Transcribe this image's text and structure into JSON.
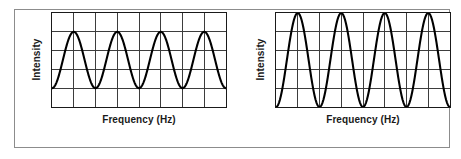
{
  "figure": {
    "background_color": "#ffffff",
    "frame_color": "#8c8c8c",
    "axis_color": "#1a1a1a",
    "grid_color": "#3a3a3a",
    "wave_color": "#000000"
  },
  "panels": [
    {
      "id": "left",
      "ylabel": "Intensity",
      "xlabel": "Frequency (Hz)"
    },
    {
      "id": "right",
      "ylabel": "Intensity",
      "xlabel": "Frequency (Hz)"
    }
  ],
  "chart_data": [
    {
      "type": "line",
      "title": "",
      "xlabel": "Frequency (Hz)",
      "ylabel": "Intensity",
      "xlim": [
        0,
        8
      ],
      "ylim": [
        0,
        5
      ],
      "grid": true,
      "grid_columns": 8,
      "grid_rows": 5,
      "xticklabels": [],
      "yticklabels": [],
      "legend": "none",
      "annotation": "low amplitude sine wave, 4 cycles",
      "waveform": {
        "shape": "sine",
        "cycles": 4,
        "amplitude": 1.5,
        "midline": 2.5,
        "peak": 4.0,
        "trough": 1.0,
        "phase_deg": 270
      },
      "x": [
        0,
        0.25,
        0.5,
        0.75,
        1,
        1.25,
        1.5,
        1.75,
        2,
        2.25,
        2.5,
        2.75,
        3,
        3.25,
        3.5,
        3.75,
        4,
        4.25,
        4.5,
        4.75,
        5,
        5.25,
        5.5,
        5.75,
        6,
        6.25,
        6.5,
        6.75,
        7,
        7.25,
        7.5,
        7.75,
        8
      ],
      "y": [
        1.0,
        1.44,
        2.5,
        3.56,
        4.0,
        3.56,
        2.5,
        1.44,
        1.0,
        1.44,
        2.5,
        3.56,
        4.0,
        3.56,
        2.5,
        1.44,
        1.0,
        1.44,
        2.5,
        3.56,
        4.0,
        3.56,
        2.5,
        1.44,
        1.0,
        1.44,
        2.5,
        3.56,
        4.0,
        3.56,
        2.5,
        1.44,
        1.0
      ]
    },
    {
      "type": "line",
      "title": "",
      "xlabel": "Frequency (Hz)",
      "ylabel": "Intensity",
      "xlim": [
        0,
        8
      ],
      "ylim": [
        0,
        5
      ],
      "grid": true,
      "grid_columns": 8,
      "grid_rows": 5,
      "xticklabels": [],
      "yticklabels": [],
      "legend": "none",
      "annotation": "high amplitude sine wave, 4 cycles",
      "waveform": {
        "shape": "sine",
        "cycles": 4,
        "amplitude": 2.5,
        "midline": 2.5,
        "peak": 5.0,
        "trough": 0.0,
        "phase_deg": 270
      },
      "x": [
        0,
        0.25,
        0.5,
        0.75,
        1,
        1.25,
        1.5,
        1.75,
        2,
        2.25,
        2.5,
        2.75,
        3,
        3.25,
        3.5,
        3.75,
        4,
        4.25,
        4.5,
        4.75,
        5,
        5.25,
        5.5,
        5.75,
        6,
        6.25,
        6.5,
        6.75,
        7,
        7.25,
        7.5,
        7.75,
        8
      ],
      "y": [
        0.0,
        0.73,
        2.5,
        4.27,
        5.0,
        4.27,
        2.5,
        0.73,
        0.0,
        0.73,
        2.5,
        4.27,
        5.0,
        4.27,
        2.5,
        0.73,
        0.0,
        0.73,
        2.5,
        4.27,
        5.0,
        4.27,
        2.5,
        0.73,
        0.0,
        0.73,
        2.5,
        4.27,
        5.0,
        4.27,
        2.5,
        0.73,
        0.0
      ]
    }
  ]
}
